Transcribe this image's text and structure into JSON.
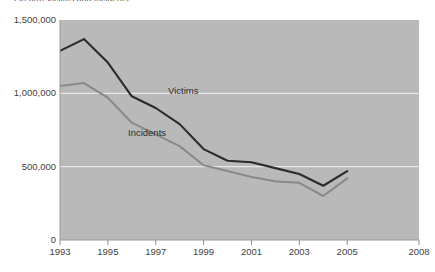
{
  "chart_data": {
    "type": "line",
    "title": "Firearm Victims and Incidents",
    "xlabel": "",
    "ylabel": "",
    "x": [
      1993,
      1994,
      1995,
      1996,
      1997,
      1998,
      1999,
      2000,
      2001,
      2002,
      2003,
      2004,
      2005
    ],
    "xlim": [
      1993,
      2008
    ],
    "ylim": [
      0,
      1500000
    ],
    "x_tick_labels": [
      "1993",
      "1995",
      "1997",
      "1999",
      "2001",
      "2003",
      "2005",
      "2008"
    ],
    "x_tick_values": [
      1993,
      1995,
      1997,
      1999,
      2001,
      2003,
      2005,
      2008
    ],
    "y_tick_labels": [
      "1,500,000",
      "1,000,000",
      "500,000",
      "0"
    ],
    "y_tick_values": [
      1500000,
      1000000,
      500000,
      0
    ],
    "grid": true,
    "grid_orientation": "horizontal",
    "legend": "inline-annotations",
    "plot_background": "#b9b9b9",
    "gridline_color": "#e8e8e8",
    "series": [
      {
        "name": "Victims",
        "color": "#2b2b2b",
        "values": [
          1290000,
          1370000,
          1210000,
          980000,
          900000,
          790000,
          620000,
          540000,
          530000,
          490000,
          450000,
          370000,
          470000
        ]
      },
      {
        "name": "Incidents",
        "color": "#8a8a8a",
        "values": [
          1050000,
          1070000,
          970000,
          800000,
          720000,
          640000,
          510000,
          470000,
          430000,
          400000,
          390000,
          300000,
          420000
        ]
      }
    ]
  },
  "annotations": {
    "victims_label": "Victims",
    "incidents_label": "Incidents"
  }
}
